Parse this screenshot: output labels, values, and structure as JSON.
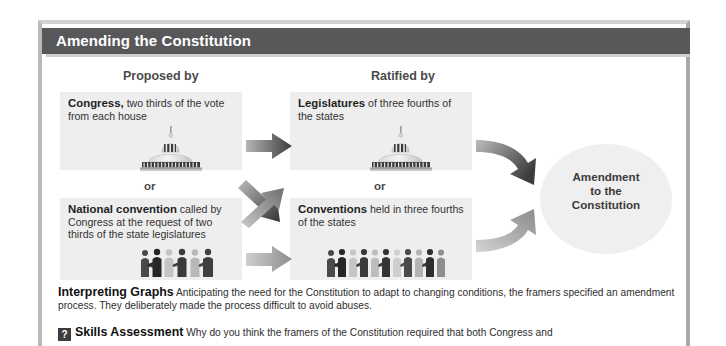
{
  "figure": {
    "title": "Amending the Constitution",
    "columns": {
      "left_heading": "Proposed by",
      "right_heading": "Ratified by"
    },
    "or_label_left": "or",
    "or_label_right": "or",
    "boxes": {
      "congress": {
        "lead": "Congress,",
        "rest": " two thirds of the vote from each house",
        "icon": "capitol-building-icon"
      },
      "national_convention": {
        "lead": "National convention",
        "rest": " called by Congress at the request of two thirds of the state legislatures",
        "icon": "people-group-icon"
      },
      "legislatures": {
        "lead": "Legislatures",
        "rest": " of three fourths of the states",
        "icon": "capitol-building-icon"
      },
      "conventions": {
        "lead": "Conventions",
        "rest": " held in three fourths of the states",
        "icon": "people-group-icon"
      }
    },
    "result": {
      "line1": "Amendment",
      "line2": "to the",
      "line3": "Constitution"
    },
    "caption": {
      "label": "Interpreting Graphs",
      "text": " Anticipating the need for the Constitution to adapt to changing conditions, the framers specified an amendment process. They deliberately made the process difficult to avoid abuses."
    },
    "assessment": {
      "icon_glyph": "?",
      "label": "Skills Assessment",
      "text": " Why do you think the framers of the Constitution required that both Congress and"
    },
    "colors": {
      "titlebar": "#58585a",
      "panel": "#eeeeee",
      "circle": "#efefef",
      "arrow_dark": "#4a4a4a",
      "arrow_light": "#9a9a9a",
      "page": "#ffffff"
    }
  }
}
